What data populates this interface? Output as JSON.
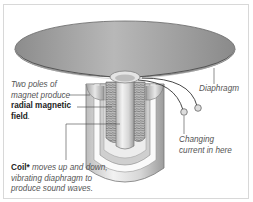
{
  "diagram": {
    "labels": {
      "diaphragm": "Diaphragm",
      "poles_line1": "Two poles of",
      "poles_line2": "magnet produce",
      "poles_bold": "radial magnetic",
      "poles_bold2": "field",
      "poles_end": ".",
      "current_line1": "Changing",
      "current_line2": "current in here",
      "coil_bold": "Coil*",
      "coil_line1": " moves up and down,",
      "coil_line2": "vibrating diaphragm to",
      "coil_line3": "produce sound waves."
    },
    "colors": {
      "diaphragm": "#9a9a9a",
      "metal_light": "#e6e6e6",
      "metal_dark": "#8a8a8a",
      "coil": "#7a7a7a",
      "leader": "#444444",
      "text": "#555555"
    }
  }
}
